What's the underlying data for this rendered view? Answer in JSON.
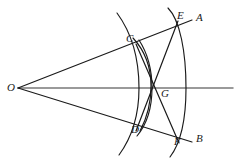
{
  "diagram": {
    "type": "geometric-construction",
    "canvas": {
      "width": 239,
      "height": 163
    },
    "colors": {
      "stroke": "#1a1a1a",
      "bisector": "#7a7a7a",
      "background": "#ffffff",
      "label": "#1a1a1a"
    },
    "points": [
      {
        "id": "O",
        "label": "O",
        "x": 18,
        "y": 88,
        "label_x": 7,
        "label_y": 84
      },
      {
        "id": "A",
        "label": "A",
        "x": 192,
        "y": 20,
        "label_x": 196,
        "label_y": 14
      },
      {
        "id": "B",
        "label": "B",
        "x": 192,
        "y": 142,
        "label_x": 196,
        "label_y": 135
      },
      {
        "id": "C",
        "label": "C",
        "x": 137,
        "y": 44,
        "label_x": 127,
        "label_y": 35
      },
      {
        "id": "D",
        "label": "D",
        "x": 139,
        "y": 127,
        "label_x": 131,
        "label_y": 126
      },
      {
        "id": "E",
        "label": "E",
        "x": 176,
        "y": 24,
        "label_x": 177,
        "label_y": 13
      },
      {
        "id": "F",
        "label": "F",
        "x": 177,
        "y": 138,
        "label_x": 174,
        "label_y": 137
      },
      {
        "id": "G",
        "label": "G",
        "x": 157,
        "y": 88,
        "label_x": 161,
        "label_y": 90
      }
    ],
    "lines": [
      {
        "id": "ray-OA",
        "from": "O",
        "to": "A",
        "label": "ray OA"
      },
      {
        "id": "ray-OB",
        "from": "O",
        "to": "B",
        "label": "ray OB"
      },
      {
        "id": "bisector-OG",
        "from": "O",
        "to": "right-edge",
        "label": "angle bisector through G"
      },
      {
        "id": "chord-CF",
        "from": "C",
        "to": "F",
        "label": "chord C to F"
      },
      {
        "id": "chord-DE",
        "from": "D",
        "to": "E",
        "label": "chord D to E"
      }
    ],
    "arcs": [
      {
        "id": "arc-CD",
        "through": [
          "C",
          "D"
        ],
        "center": "O",
        "label": "arc centered at O through C and D"
      },
      {
        "id": "arc-C",
        "through": [
          "C"
        ],
        "center": "D",
        "label": "arc centered at D through C"
      },
      {
        "id": "arc-D",
        "through": [
          "D"
        ],
        "center": "C",
        "label": "arc centered at C through D"
      },
      {
        "id": "arc-EF",
        "through": [
          "E",
          "F"
        ],
        "center": "O",
        "label": "outer arc through E and F"
      }
    ]
  }
}
